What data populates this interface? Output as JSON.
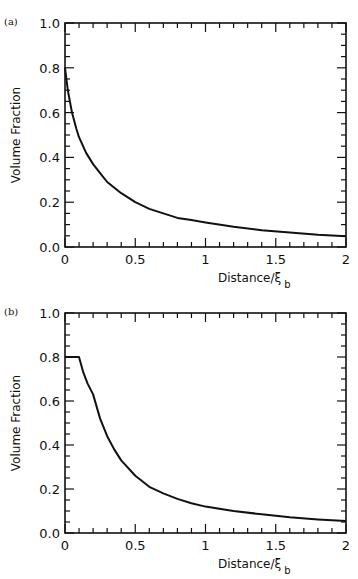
{
  "chart_data": [
    {
      "type": "line",
      "panel_label": "(a)",
      "title": "",
      "xlabel": "Distance/ξ",
      "xlabel_subscript": "b",
      "ylabel": "Volume Fraction",
      "xlim": [
        0,
        2
      ],
      "ylim": [
        0,
        1.0
      ],
      "x_ticks": [
        "0",
        "0.5",
        "1",
        "1.5",
        "2"
      ],
      "y_ticks": [
        "0.0",
        "0.2",
        "0.4",
        "0.6",
        "0.8",
        "1.0"
      ],
      "grid": false,
      "series": [
        {
          "name": "volume fraction",
          "x": [
            0,
            0.02,
            0.05,
            0.08,
            0.1,
            0.15,
            0.2,
            0.25,
            0.3,
            0.4,
            0.5,
            0.6,
            0.7,
            0.8,
            0.9,
            1.0,
            1.2,
            1.4,
            1.6,
            1.8,
            2.0
          ],
          "y": [
            0.8,
            0.7,
            0.6,
            0.53,
            0.49,
            0.42,
            0.37,
            0.33,
            0.29,
            0.24,
            0.2,
            0.17,
            0.15,
            0.13,
            0.12,
            0.11,
            0.09,
            0.075,
            0.065,
            0.055,
            0.048
          ]
        }
      ]
    },
    {
      "type": "line",
      "panel_label": "(b)",
      "title": "",
      "xlabel": "Distance/ξ",
      "xlabel_subscript": "b",
      "ylabel": "Volume Fraction",
      "xlim": [
        0,
        2
      ],
      "ylim": [
        0,
        1.0
      ],
      "x_ticks": [
        "0",
        "0.5",
        "1",
        "1.5",
        "2"
      ],
      "y_ticks": [
        "0.0",
        "0.2",
        "0.4",
        "0.6",
        "0.8",
        "1.0"
      ],
      "grid": false,
      "series": [
        {
          "name": "volume fraction",
          "x": [
            0,
            0.05,
            0.1,
            0.13,
            0.16,
            0.2,
            0.25,
            0.3,
            0.35,
            0.4,
            0.5,
            0.6,
            0.7,
            0.8,
            0.9,
            1.0,
            1.2,
            1.4,
            1.6,
            1.8,
            2.0
          ],
          "y": [
            0.8,
            0.8,
            0.8,
            0.73,
            0.68,
            0.63,
            0.52,
            0.44,
            0.38,
            0.33,
            0.26,
            0.21,
            0.18,
            0.155,
            0.135,
            0.12,
            0.1,
            0.085,
            0.072,
            0.062,
            0.054
          ]
        }
      ]
    }
  ]
}
